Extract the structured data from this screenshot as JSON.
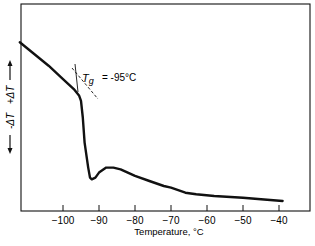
{
  "chart_data": {
    "type": "line",
    "title": "",
    "xlabel": "Temperature, °C",
    "ylabel": "← -ΔT   +ΔT →",
    "ylabel_parts": {
      "negative": "-ΔT",
      "positive": "+ΔT"
    },
    "xlim": [
      -112,
      -32
    ],
    "xticks": [
      -100,
      -90,
      -80,
      -70,
      -60,
      -50,
      -40
    ],
    "xtick_labels": [
      "-100",
      "-90",
      "-80",
      "-70",
      "-60",
      "-50",
      "-40"
    ],
    "grid": false,
    "annotation": {
      "label": "Tg",
      "text": "= -95°C",
      "x": -95
    },
    "series": [
      {
        "name": "DTA curve",
        "x": [
          -112,
          -108,
          -104,
          -100,
          -97,
          -95.5,
          -95,
          -94.5,
          -94,
          -93,
          -92.5,
          -92,
          -91,
          -90,
          -88,
          -86,
          -84,
          -80,
          -76,
          -72,
          -70,
          -66,
          -63,
          -58,
          -50,
          -45,
          -39
        ],
        "y": [
          0.95,
          0.88,
          0.81,
          0.73,
          0.67,
          0.63,
          0.6,
          0.5,
          0.35,
          0.2,
          0.14,
          0.13,
          0.14,
          0.17,
          0.2,
          0.2,
          0.19,
          0.15,
          0.12,
          0.09,
          0.08,
          0.05,
          0.04,
          0.03,
          0.02,
          0.01,
          0.0
        ]
      }
    ]
  }
}
